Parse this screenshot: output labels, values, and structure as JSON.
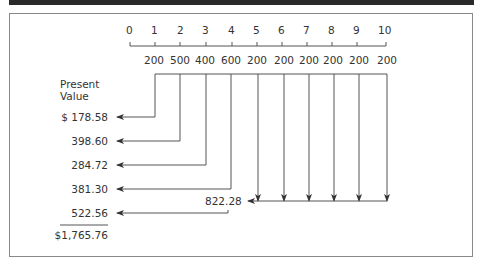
{
  "timeline": {
    "periods": [
      "0",
      "1",
      "2",
      "3",
      "4",
      "5",
      "6",
      "7",
      "8",
      "9",
      "10"
    ],
    "cash_flows": [
      "200",
      "500",
      "400",
      "600",
      "200",
      "200",
      "200",
      "200",
      "200",
      "200"
    ]
  },
  "present_value": {
    "heading_line1": "Present",
    "heading_line2": "Value",
    "values": [
      "$ 178.58",
      "398.60",
      "284.72",
      "381.30",
      "522.56"
    ],
    "annuity_pv": "822.28",
    "total": "$1,765.76"
  }
}
